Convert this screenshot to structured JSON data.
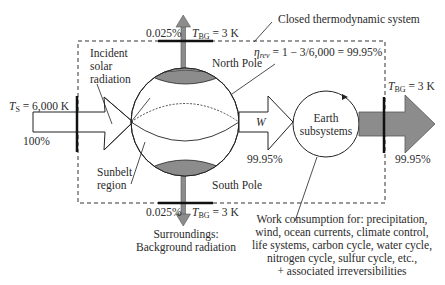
{
  "diagram": {
    "title": "Closed thermodynamic system",
    "efficiency": {
      "symbol": "η",
      "subscript": "rev",
      "expression": " = 1 − 3/6,000 = 99.95%"
    },
    "source": {
      "temp_symbol": "T",
      "temp_subscript": "S",
      "temp_value": " = 6,000 K",
      "percent": "100%",
      "label_line1": "Incident",
      "label_line2": "solar",
      "label_line3": "radiation"
    },
    "north": {
      "label": "North Pole",
      "percent": "0.025%",
      "temp_symbol": "T",
      "temp_subscript": "BG",
      "temp_value": " = 3 K"
    },
    "south": {
      "label": "South Pole",
      "percent": "0.025%",
      "temp_symbol": "T",
      "temp_subscript": "BG",
      "temp_value": " = 3 K"
    },
    "sunbelt": {
      "line1": "Sunbelt",
      "line2": "region"
    },
    "work": {
      "symbol": "W",
      "percent": "99.95%"
    },
    "earth_subsystems": {
      "line1": "Earth",
      "line2": "subsystems"
    },
    "output": {
      "temp_symbol": "T",
      "temp_subscript": "BG",
      "temp_value": " = 3 K",
      "percent": "99.95%"
    },
    "surroundings": {
      "line1": "Surroundings:",
      "line2": "Background radiation"
    },
    "work_consumption": [
      "Work consumption for: precipitation,",
      "wind, ocean currents, climate control,",
      "life systems, carbon cycle, water cycle,",
      "nitrogen cycle, sulfur cycle, etc.,",
      "+ associated irreversibilities"
    ],
    "colors": {
      "line": "#1a1a1a",
      "pole_fill": "#8c8c8c",
      "arrow_gray": "#8c8c8c",
      "dashed": "#333333"
    }
  }
}
